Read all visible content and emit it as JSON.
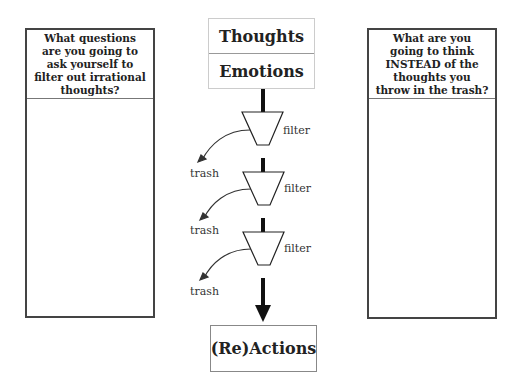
{
  "left_panel": {
    "question": "What questions are you going to ask yourself to filter out irrational thoughts?"
  },
  "right_panel": {
    "question": "What are you going to think INSTEAD of the thoughts you throw in the trash?"
  },
  "flow": {
    "top_boxes": [
      "Thoughts",
      "Emotions"
    ],
    "filters": [
      {
        "label": "filter",
        "trash_label": "trash"
      },
      {
        "label": "filter",
        "trash_label": "trash"
      },
      {
        "label": "filter",
        "trash_label": "trash"
      }
    ],
    "output_box": "(Re)Actions"
  }
}
